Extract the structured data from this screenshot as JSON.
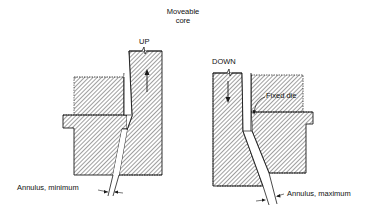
{
  "diagram": {
    "title_line1": "Moveable",
    "title_line2": "core",
    "left_panel": {
      "direction_label": "UP",
      "annulus_label": "Annulus, minimum"
    },
    "right_panel": {
      "direction_label": "DOWN",
      "fixed_die_label": "Fixed die",
      "annulus_label": "Annulus, maximum"
    },
    "colors": {
      "line": "#1a1a1a",
      "hatch": "#2a2a2a",
      "background": "#ffffff"
    }
  }
}
